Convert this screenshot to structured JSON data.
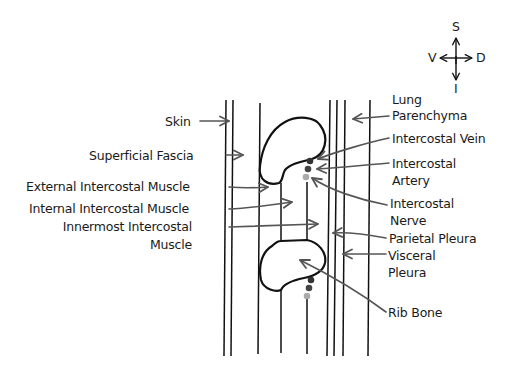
{
  "diagram": {
    "type": "anatomical-cross-section",
    "colors": {
      "line": "#111111",
      "arrow": "#555555",
      "vein_dot": "#333333",
      "artery_dot": "#444444",
      "nerve_dot": "#aaaaaa"
    }
  },
  "compass": {
    "top": "S",
    "bottom": "I",
    "left": "V",
    "right": "D"
  },
  "labels_left": {
    "skin": "Skin",
    "superficial_fascia": "Superficial Fascia",
    "external_intercostal": "External Intercostal Muscle",
    "internal_intercostal": "Internal Intercostal Muscle",
    "innermost_intercostal_line1": "Innermost Intercostal",
    "innermost_intercostal_line2": "Muscle"
  },
  "labels_right": {
    "lung_parenchyma_line1": "Lung",
    "lung_parenchyma_line2": "Parenchyma",
    "intercostal_vein": "Intercostal Vein",
    "intercostal_artery_line1": "Intercostal",
    "intercostal_artery_line2": "Artery",
    "intercostal_nerve_line1": "Intercostal",
    "intercostal_nerve_line2": "Nerve",
    "parietal_pleura": "Parietal Pleura",
    "visceral_pleura_line1": "Visceral",
    "visceral_pleura_line2": "Pleura",
    "rib_bone": "Rib Bone"
  }
}
